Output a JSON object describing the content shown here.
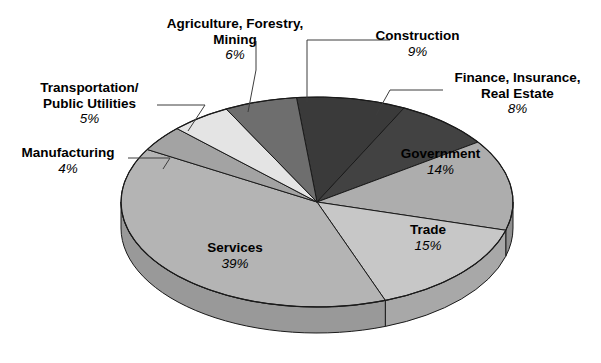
{
  "chart_data": {
    "type": "pie",
    "title": "",
    "subtitle": "",
    "xlabel": "",
    "ylabel": "",
    "legend_position": "labels-with-leader-lines",
    "grid": false,
    "units": "percent",
    "categories": [
      "Construction",
      "Finance, Insurance, Real Estate",
      "Government",
      "Trade",
      "Services",
      "Manufacturing",
      "Transportation/Public Utilities",
      "Agriculture, Forestry, Mining"
    ],
    "values": [
      9,
      8,
      14,
      15,
      39,
      4,
      5,
      6
    ],
    "slices": [
      {
        "label": "Construction",
        "value": 9,
        "pct_text": "9%",
        "color": "#3a3a3a",
        "side_color": "#2a2a2a"
      },
      {
        "label": "Finance, Insurance, Real Estate",
        "value": 8,
        "pct_text": "8%",
        "color": "#424242",
        "side_color": "#303030"
      },
      {
        "label": "Government",
        "value": 14,
        "pct_text": "14%",
        "color": "#adadad",
        "side_color": "#8f8f8f"
      },
      {
        "label": "Trade",
        "value": 15,
        "pct_text": "15%",
        "color": "#c7c7c7",
        "side_color": "#a8a8a8"
      },
      {
        "label": "Services",
        "value": 39,
        "pct_text": "39%",
        "color": "#b4b4b4",
        "side_color": "#999999"
      },
      {
        "label": "Manufacturing",
        "value": 4,
        "pct_text": "4%",
        "color": "#a3a3a3",
        "side_color": "#878787"
      },
      {
        "label": "Transportation/Public Utilities",
        "value": 5,
        "pct_text": "5%",
        "color": "#e4e4e4",
        "side_color": "#c0c0c0"
      },
      {
        "label": "Agriculture, Forestry, Mining",
        "value": 6,
        "pct_text": "6%",
        "color": "#6e6e6e",
        "side_color": "#5a5a5a"
      }
    ]
  },
  "labels": {
    "agriculture": {
      "line1": "Agriculture, Forestry,",
      "line2": "Mining",
      "pct": "6%"
    },
    "transportation": {
      "line1": "Transportation/",
      "line2": "Public Utilities",
      "pct": "5%"
    },
    "manufacturing": {
      "line1": "Manufacturing",
      "pct": "4%"
    },
    "construction": {
      "line1": "Construction",
      "pct": "9%"
    },
    "finance": {
      "line1": "Finance, Insurance,",
      "line2": "Real Estate",
      "pct": "8%"
    },
    "government": {
      "line1": "Government",
      "pct": "14%"
    },
    "trade": {
      "line1": "Trade",
      "pct": "15%"
    },
    "services": {
      "line1": "Services",
      "pct": "39%"
    }
  },
  "colors": {
    "background": "#ffffff",
    "outline": "#1a1a1a",
    "leader_line": "#3d3d3d",
    "text": "#000000"
  }
}
